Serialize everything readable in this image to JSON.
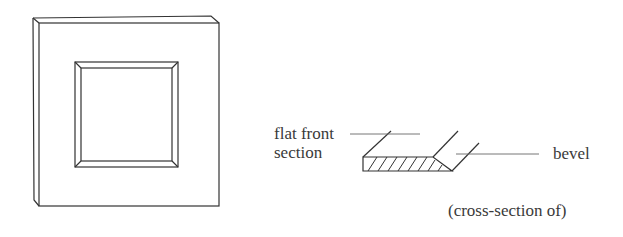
{
  "labels": {
    "flat_front_line1": "flat front",
    "flat_front_line2": "section",
    "bevel": "bevel",
    "caption": "(cross-section of)"
  },
  "figures": {
    "left": "beveled square frame drawing",
    "right": "cross-section of frame showing flat front section and bevel"
  },
  "colors": {
    "stroke": "#333333",
    "background": "#ffffff"
  }
}
